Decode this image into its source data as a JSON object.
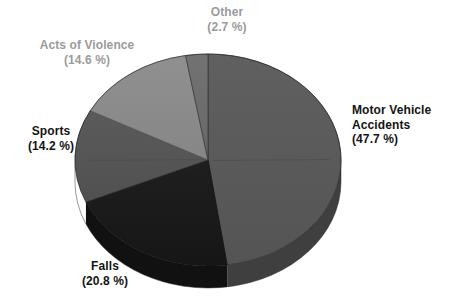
{
  "chart_data": {
    "type": "pie",
    "title": "",
    "subtitle": "",
    "xlabel": "",
    "ylabel": "",
    "legend_position": "none",
    "grid": false,
    "units": "percent",
    "start_angle_deg": 0,
    "direction": "clockwise",
    "three_d": true,
    "categories": [
      "Motor Vehicle Accidents",
      "Falls",
      "Sports",
      "Acts of Violence",
      "Other"
    ],
    "values": [
      47.7,
      20.8,
      14.2,
      14.6,
      2.7
    ],
    "slices": [
      {
        "label": "Motor Vehicle",
        "label_line2": "Accidents",
        "name": "Motor Vehicle Accidents",
        "percent_text": "(47.7 %)",
        "value": 47.7,
        "color": "#5a5a5a",
        "side_color": "#3f3f3f",
        "label_color": "#141414"
      },
      {
        "label": "Falls",
        "name": "Falls",
        "percent_text": "(20.8 %)",
        "value": 20.8,
        "color": "#1b1b1b",
        "side_color": "#111111",
        "label_color": "#141414"
      },
      {
        "label": "Sports",
        "name": "Sports",
        "percent_text": "(14.2 %)",
        "value": 14.2,
        "color": "#565656",
        "side_color": "#3b3b3b",
        "label_color": "#141414"
      },
      {
        "label": "Acts of Violence",
        "name": "Acts of Violence",
        "percent_text": "(14.6 %)",
        "value": 14.6,
        "color": "#8b8b8b",
        "side_color": "#636363",
        "label_color": "#9b9b9b"
      },
      {
        "label": "Other",
        "name": "Other",
        "percent_text": "(2.7 %)",
        "value": 2.7,
        "color": "#6d6d6d",
        "side_color": "#4c4c4c",
        "label_color": "#9b9b9b"
      }
    ]
  },
  "colors": {
    "background": "#ffffff",
    "label_dark": "#141414",
    "label_gray": "#9b9b9b",
    "outline": "#2a2a2a"
  },
  "labels": {
    "motor_vehicle": {
      "line1": "Motor Vehicle",
      "line2": "Accidents",
      "percent": "(47.7 %)"
    },
    "falls": {
      "line1": "Falls",
      "percent": "(20.8 %)"
    },
    "sports": {
      "line1": "Sports",
      "percent": "(14.2 %)"
    },
    "acts_of_violence": {
      "line1": "Acts of Violence",
      "percent": "(14.6 %)"
    },
    "other": {
      "line1": "Other",
      "percent": "(2.7 %)"
    }
  }
}
